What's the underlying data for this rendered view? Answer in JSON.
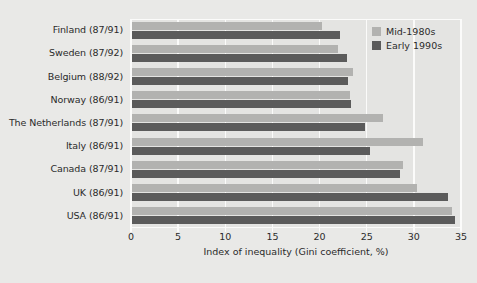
{
  "chart_data": {
    "type": "bar",
    "orientation": "horizontal",
    "title": "",
    "xlabel": "Index of inequality (Gini coefficient, %)",
    "ylabel": "",
    "xlim": [
      0,
      35
    ],
    "xticks": [
      0,
      5,
      10,
      15,
      20,
      25,
      30,
      35
    ],
    "xtick_labels": [
      "0",
      "5",
      "10",
      "15",
      "20",
      "25",
      "30",
      "35"
    ],
    "grid": true,
    "grid_axis": "x",
    "legend_position": "top-right",
    "categories": [
      "Finland (87/91)",
      "Sweden (87/92)",
      "Belgium (88/92)",
      "Norway (86/91)",
      "The Netherlands (87/91)",
      "Italy (86/91)",
      "Canada (87/91)",
      "UK (86/91)",
      "USA (86/91)"
    ],
    "series": [
      {
        "name": "Mid-1980s",
        "color": "#b2b2b0",
        "values": [
          20.3,
          22.0,
          23.5,
          23.2,
          26.7,
          31.0,
          28.8,
          30.3,
          34.0
        ]
      },
      {
        "name": "Early 1990s",
        "color": "#5b5b5b",
        "values": [
          22.2,
          22.9,
          23.0,
          23.3,
          24.8,
          25.4,
          28.5,
          33.6,
          34.4
        ]
      }
    ]
  },
  "colors": {
    "background": "#e9e9e7",
    "plot_background": "#e4e4e2",
    "gridline": "#fbfbfa",
    "text": "#2b2b2b",
    "series_mid_1980s": "#b2b2b0",
    "series_early_1990s": "#5b5b5b"
  }
}
